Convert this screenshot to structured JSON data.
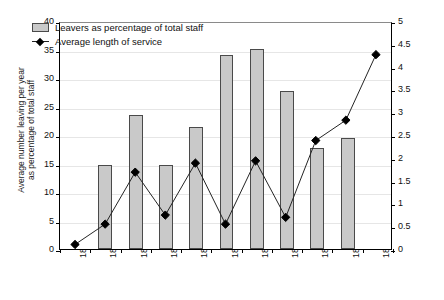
{
  "chart_data": {
    "type": "bar",
    "title": "",
    "subtitle": "",
    "categories": [
      "1846–9",
      "1850–4",
      "1855–9",
      "1860–4",
      "1865–9",
      "1870–4",
      "1875–9",
      "1880–4",
      "1885–9",
      "1890–4",
      "1895–9"
    ],
    "xlabel": "",
    "ylabel": "Average number leaving per year as percentage of total staff",
    "ylabel_line1": "Average number leaving per year",
    "ylabel_line2": "as percentage of total staff",
    "ylabel_secondary": "Average length of service (years)",
    "ylim": [
      0,
      40
    ],
    "ylim_secondary": [
      0,
      5
    ],
    "yticks": [
      0,
      5,
      10,
      15,
      20,
      25,
      30,
      35,
      40
    ],
    "ytick_labels": [
      "0",
      "5",
      "10",
      "15",
      "20",
      "25",
      "30",
      "35",
      "40"
    ],
    "yticks_secondary": [
      0,
      0.5,
      1,
      1.5,
      2,
      2.5,
      3,
      3.5,
      4,
      4.5,
      5
    ],
    "ytick_labels_secondary": [
      "0",
      "0.5",
      "1",
      "1.5",
      "2",
      "2.5",
      "3",
      "3.5",
      "4",
      "4.5",
      "5"
    ],
    "grid": true,
    "legend_position": "top-left",
    "series": [
      {
        "name": "Leavers as percentage of total staff",
        "type": "bar",
        "axis": "left",
        "color": "#c9c9c9",
        "edge_color": "#4a4a4a",
        "values": [
          0,
          14.7,
          23.5,
          14.7,
          21.4,
          34.0,
          35.1,
          27.7,
          17.8,
          19.5,
          0
        ]
      },
      {
        "name": "Average length of service",
        "type": "line",
        "axis": "right",
        "color": "#222222",
        "marker": "diamond",
        "values": [
          0.1,
          0.55,
          1.7,
          0.75,
          1.9,
          0.55,
          1.95,
          0.7,
          2.4,
          2.85,
          4.3
        ]
      }
    ]
  },
  "legend": {
    "items": [
      {
        "label": "Leavers as percentage of total staff",
        "marker": "bar-swatch"
      },
      {
        "label": "Average length of service",
        "marker": "line-diamond"
      }
    ]
  }
}
